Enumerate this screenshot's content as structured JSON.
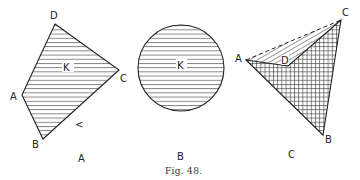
{
  "figure": {
    "caption": "Fig. 48.",
    "panels": [
      {
        "id": "A",
        "caption": "A",
        "shape": "quadrilateral",
        "fill": "horizontal-hatch",
        "vertices": [
          {
            "label": "D",
            "x": 55,
            "y": 24
          },
          {
            "label": "C",
            "x": 119,
            "y": 70
          },
          {
            "label": "B",
            "x": 43,
            "y": 139
          },
          {
            "label": "A",
            "x": 22,
            "y": 95
          }
        ],
        "region_label": "K",
        "mark": "<"
      },
      {
        "id": "B",
        "caption": "B",
        "shape": "circle",
        "fill": "horizontal-hatch",
        "center": {
          "x": 181,
          "y": 68
        },
        "radius": 43,
        "region_label": "K"
      },
      {
        "id": "C",
        "caption": "C",
        "shape": "non-convex quadrilateral",
        "fill": "cross-hatch (ABCD) + diagonal hatch (triangle ACD)",
        "vertices": [
          {
            "label": "A",
            "x": 246,
            "y": 60
          },
          {
            "label": "D",
            "x": 288,
            "y": 66
          },
          {
            "label": "C",
            "x": 341,
            "y": 20
          },
          {
            "label": "B",
            "x": 323,
            "y": 135
          }
        ],
        "dashed_edge": "AC"
      }
    ]
  }
}
